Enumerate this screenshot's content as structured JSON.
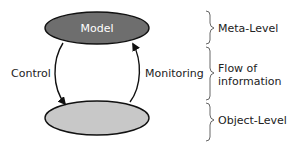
{
  "diagram": {
    "nodes": {
      "meta": {
        "label": "Model",
        "fill": "#6e6e6e",
        "stroke": "#111111"
      },
      "object": {
        "label": "",
        "fill": "#c8c8c8",
        "stroke": "#111111"
      }
    },
    "edges": {
      "control": {
        "label": "Control",
        "from": "meta",
        "to": "object"
      },
      "monitoring": {
        "label": "Monitoring",
        "from": "object",
        "to": "meta"
      }
    },
    "levels": [
      {
        "label_lines": [
          "Meta-Level"
        ]
      },
      {
        "label_lines": [
          "Flow of",
          "information"
        ]
      },
      {
        "label_lines": [
          "Object-Level"
        ]
      }
    ]
  }
}
